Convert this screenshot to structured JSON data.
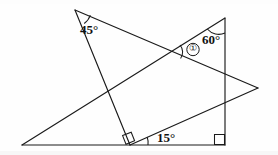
{
  "figure": {
    "background_color": "#fefefe",
    "line_color": "#1a1a1a",
    "labels": {
      "angle_top_left": "45°",
      "angle_top_right": "60°",
      "angle_base": "15°",
      "marked_angle": "①"
    },
    "icon_names": {
      "right_angle_base": "right-angle-square-icon",
      "right_angle_corner": "right-angle-square-icon",
      "arc_45": "angle-arc-icon",
      "arc_60": "angle-arc-icon",
      "arc_15": "angle-arc-icon",
      "arc_marked": "angle-arc-icon",
      "circle_marker": "circled-number-icon"
    },
    "points": {
      "apex_left": [
        75,
        10
      ],
      "apex_right": [
        225,
        18
      ],
      "base_left": [
        22,
        145
      ],
      "base_right": [
        225,
        145
      ],
      "foot_perp": [
        130,
        145
      ],
      "right_vertex": [
        258,
        88
      ],
      "crossing_lower_left": [
        105,
        97
      ],
      "crossing_upper_right": [
        172,
        52
      ]
    },
    "segments": [
      {
        "name": "baseline",
        "from": [
          22,
          145
        ],
        "to": [
          225,
          145
        ]
      },
      {
        "name": "vertical-right",
        "from": [
          225,
          18
        ],
        "to": [
          225,
          145
        ]
      },
      {
        "name": "apex-left-to-right-vertex",
        "from": [
          75,
          10
        ],
        "to": [
          258,
          88
        ]
      },
      {
        "name": "apex-left-to-foot",
        "from": [
          75,
          10
        ],
        "to": [
          130,
          145
        ]
      },
      {
        "name": "base-left-to-apex-right",
        "from": [
          22,
          145
        ],
        "to": [
          225,
          18
        ]
      },
      {
        "name": "foot-to-right-vertex",
        "from": [
          130,
          145
        ],
        "to": [
          258,
          88
        ]
      }
    ],
    "angle_values": {
      "at_apex_left_degrees": 45,
      "at_apex_right_degrees": 60,
      "at_base_degrees": 15,
      "right_angles_degrees": 90
    }
  }
}
